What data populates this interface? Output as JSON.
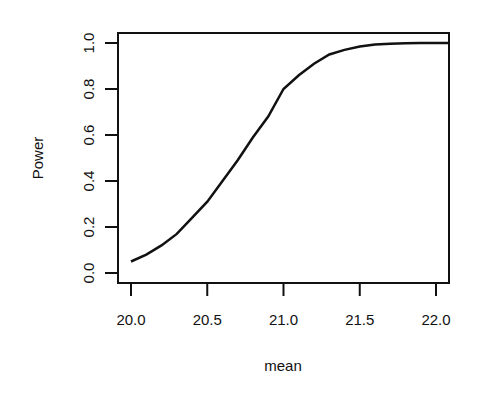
{
  "chart_data": {
    "type": "line",
    "title": "",
    "xlabel": "mean",
    "ylabel": "Power",
    "xlim": [
      19.96,
      22.08
    ],
    "ylim": [
      -0.04,
      1.04
    ],
    "grid": false,
    "legend": null,
    "x_ticks": [
      "20.0",
      "20.5",
      "21.0",
      "21.5",
      "22.0"
    ],
    "y_ticks": [
      "0.0",
      "0.2",
      "0.4",
      "0.6",
      "0.8",
      "1.0"
    ],
    "series": [
      {
        "name": "Power",
        "x": [
          20.0,
          20.1,
          20.2,
          20.3,
          20.4,
          20.5,
          20.6,
          20.7,
          20.8,
          20.9,
          21.0,
          21.1,
          21.2,
          21.3,
          21.4,
          21.5,
          21.6,
          21.7,
          21.8,
          21.9,
          22.0,
          22.08
        ],
        "values": [
          0.05,
          0.08,
          0.12,
          0.17,
          0.24,
          0.31,
          0.4,
          0.49,
          0.59,
          0.68,
          0.8,
          0.86,
          0.91,
          0.95,
          0.97,
          0.985,
          0.993,
          0.997,
          0.999,
          1.0,
          1.0,
          1.0
        ]
      }
    ]
  }
}
